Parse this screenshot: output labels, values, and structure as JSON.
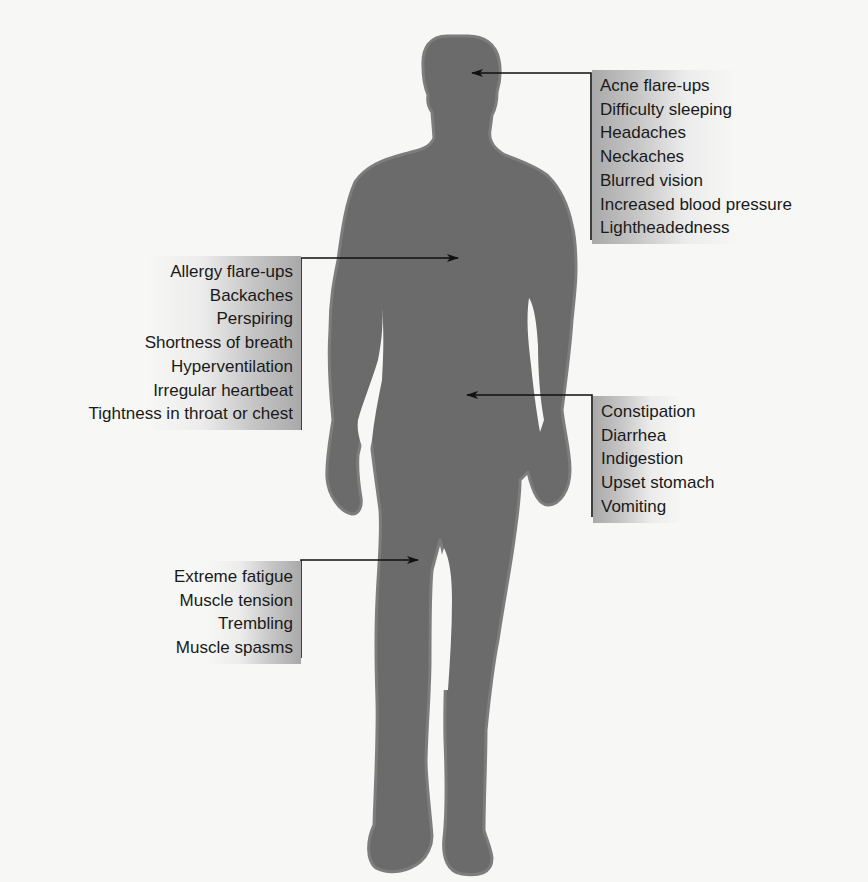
{
  "diagram": {
    "title": "",
    "colors": {
      "background": "#f7f7f5",
      "silhouette": "#6b6b6b",
      "silhouette_edge": "#7d7d7d",
      "line": "#111111",
      "label_shade": "#a9a9a9"
    },
    "callouts": [
      {
        "id": "head",
        "side": "right",
        "target": "head",
        "items": [
          "Acne flare-ups",
          "Difficulty sleeping",
          "Headaches",
          "Neckaches",
          "Blurred vision",
          "Increased blood pressure",
          "Lightheadedness"
        ]
      },
      {
        "id": "chest",
        "side": "left",
        "target": "chest",
        "items": [
          "Allergy flare-ups",
          "Backaches",
          "Perspiring",
          "Shortness of breath",
          "Hyperventilation",
          "Irregular heartbeat",
          "Tightness in throat or chest"
        ]
      },
      {
        "id": "abdomen",
        "side": "right",
        "target": "abdomen",
        "items": [
          "Constipation",
          "Diarrhea",
          "Indigestion",
          "Upset stomach",
          "Vomiting"
        ]
      },
      {
        "id": "legs",
        "side": "left",
        "target": "legs",
        "items": [
          "Extreme fatigue",
          "Muscle tension",
          "Trembling",
          "Muscle spasms"
        ]
      }
    ]
  }
}
